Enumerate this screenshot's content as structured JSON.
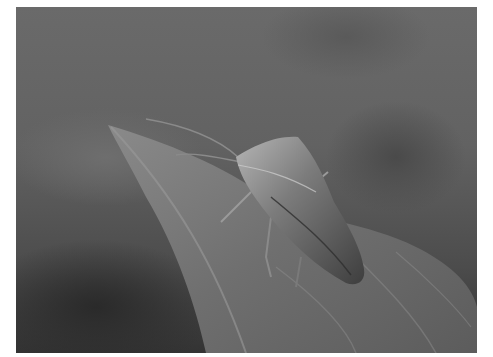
{
  "image": {
    "description": "Grayscale macro photograph of a shield bug resting on the tip of a leaf against a blurred background",
    "subject": "shield bug",
    "setting": "leaf",
    "color_mode": "grayscale",
    "border_color": "#ffffff"
  }
}
